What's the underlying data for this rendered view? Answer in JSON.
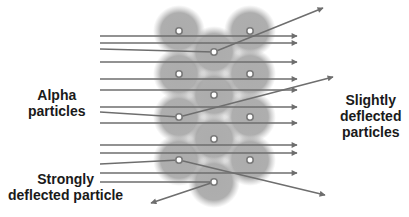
{
  "labels": {
    "alpha": {
      "line1": "Alpha",
      "line2": "particles"
    },
    "slight": {
      "line1": "Slightly",
      "line2": "deflected",
      "line3": "particles"
    },
    "strong": {
      "line1": "Strongly",
      "line2": "deflected particle"
    }
  },
  "colors": {
    "arrow": "#6e6e6e",
    "atom_cloud": "#9a9a9a",
    "nucleus_fill": "#ffffff",
    "nucleus_ring": "#7a7a7a",
    "text": "#1a1a1a"
  },
  "nuclei": [
    {
      "x": 179,
      "y": 31
    },
    {
      "x": 250,
      "y": 31
    },
    {
      "x": 214,
      "y": 52
    },
    {
      "x": 179,
      "y": 74
    },
    {
      "x": 250,
      "y": 74
    },
    {
      "x": 214,
      "y": 95
    },
    {
      "x": 179,
      "y": 117
    },
    {
      "x": 250,
      "y": 117
    },
    {
      "x": 214,
      "y": 139
    },
    {
      "x": 179,
      "y": 160
    },
    {
      "x": 250,
      "y": 160
    },
    {
      "x": 214,
      "y": 182
    }
  ],
  "straight_paths_y": [
    36,
    43,
    62,
    79,
    90,
    107,
    123,
    145,
    153,
    173
  ],
  "deflected_paths": [
    {
      "type": "slight",
      "points": [
        [
          100,
          49
        ],
        [
          214,
          52
        ],
        [
          323,
          8
        ]
      ]
    },
    {
      "type": "slight",
      "points": [
        [
          100,
          112
        ],
        [
          179,
          117
        ],
        [
          333,
          77
        ]
      ]
    },
    {
      "type": "slight",
      "points": [
        [
          100,
          164
        ],
        [
          179,
          160
        ],
        [
          325,
          195
        ]
      ]
    },
    {
      "type": "strong",
      "points": [
        [
          100,
          182
        ],
        [
          214,
          182
        ],
        [
          151,
          203
        ]
      ]
    }
  ]
}
